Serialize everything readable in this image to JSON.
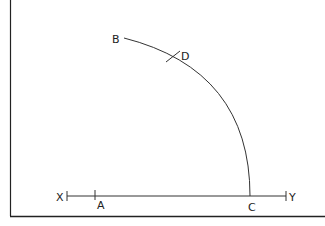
{
  "diagram": {
    "type": "geometric-construction",
    "labels": {
      "x": "X",
      "y": "Y",
      "a": "A",
      "b": "B",
      "c": "C",
      "d": "D"
    },
    "colors": {
      "stroke": "#333333",
      "frame": "#222222",
      "background": "#ffffff"
    }
  }
}
